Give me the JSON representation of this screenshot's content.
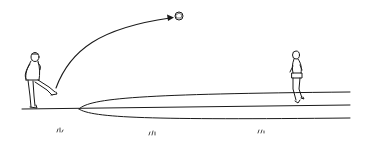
{
  "illustration": {
    "description": "Line drawing: a player on the left kicks a ball in a high arc toward a second player running on the right along a field lane",
    "colors": {
      "ink": "#1a1a1a",
      "background": "#ffffff"
    },
    "elements": {
      "kicker": "player-kicking",
      "ball": "ball",
      "trajectory": "arc-with-arrow",
      "receiver": "player-running",
      "field": "ground-lines",
      "grass": [
        "grass-tuft",
        "grass-tuft",
        "grass-tuft"
      ]
    }
  }
}
